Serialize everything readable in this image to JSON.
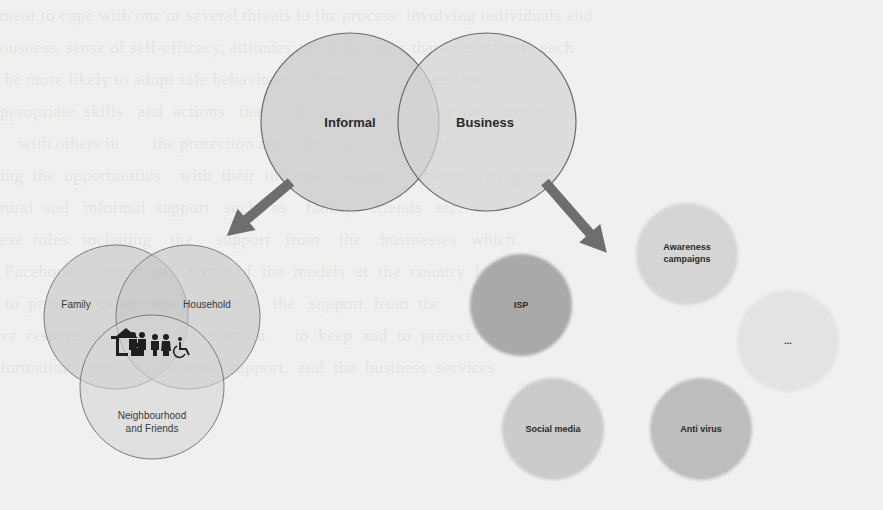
{
  "diagram": {
    "top_venn": {
      "circles": [
        {
          "label": "Informal",
          "cx": 350,
          "cy": 122,
          "r": 89
        },
        {
          "label": "Business",
          "cx": 487,
          "cy": 122,
          "r": 89
        }
      ]
    },
    "informal_venn": {
      "circles": [
        {
          "label": "Family",
          "cx": 116,
          "cy": 317,
          "r": 72
        },
        {
          "label": "Household",
          "cx": 188,
          "cy": 317,
          "r": 72
        },
        {
          "label_line1": "Neighbourhood",
          "label_line2": "and Friends",
          "cx": 152,
          "cy": 387,
          "r": 72
        }
      ],
      "center_icon": "family-household-disability-icon"
    },
    "business_nodes": [
      {
        "label": "ISP",
        "cx": 521,
        "cy": 305,
        "r": 51,
        "fill": "#a8a8a8"
      },
      {
        "label_line1": "Awareness",
        "label_line2": "campaigns",
        "cx": 687,
        "cy": 254,
        "r": 51,
        "fill": "#d4d4d4"
      },
      {
        "label": "...",
        "cx": 788,
        "cy": 341,
        "r": 51,
        "fill": "#e2e2e2"
      },
      {
        "label": "Social media",
        "cx": 553,
        "cy": 429,
        "r": 51,
        "fill": "#cacaca"
      },
      {
        "label": "Anti virus",
        "cx": 701,
        "cy": 429,
        "r": 51,
        "fill": "#bdbdbd"
      }
    ],
    "arrows": [
      {
        "name": "informal-to-subgroups-arrow",
        "from": [
          291,
          182
        ],
        "to": [
          228,
          235
        ]
      },
      {
        "name": "business-to-measures-arrow",
        "from": [
          545,
          182
        ],
        "to": [
          607,
          253
        ]
      }
    ],
    "colors": {
      "background": "#f1f0ee",
      "circle_fill": "#d0d0d0",
      "circle_stroke": "#6a6a6a",
      "arrow": "#6e6e6e",
      "text": "#2a2a2a"
    }
  }
}
